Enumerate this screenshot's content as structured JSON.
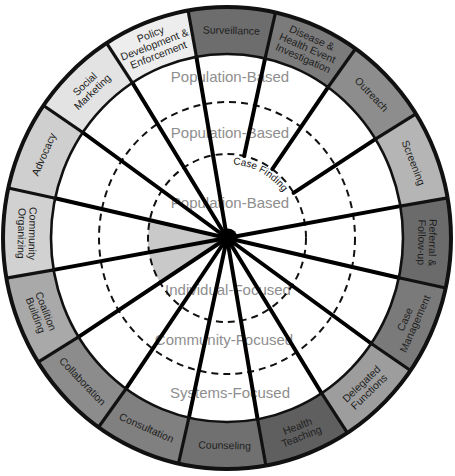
{
  "ring": {
    "segments": [
      {
        "name": "Surveillance",
        "lines": [
          "Surveillance"
        ],
        "color": "#6d6d6d"
      },
      {
        "name": "Disease & Health Event Investigation",
        "lines": [
          "Disease &",
          "Health Event",
          "Investigation"
        ],
        "color": "#7b7b7b"
      },
      {
        "name": "Outreach",
        "lines": [
          "Outreach"
        ],
        "color": "#8d8d8d"
      },
      {
        "name": "Screening",
        "lines": [
          "Screening"
        ],
        "color": "#b5b5b5"
      },
      {
        "name": "Referral & Follow-up",
        "lines": [
          "Referral &",
          "Follow-up"
        ],
        "color": "#6b6b6b"
      },
      {
        "name": "Case Management",
        "lines": [
          "Case",
          "Management"
        ],
        "color": "#7a7a7a"
      },
      {
        "name": "Delegated Functions",
        "lines": [
          "Delegated",
          "Functions"
        ],
        "color": "#9d9d9d"
      },
      {
        "name": "Health Teaching",
        "lines": [
          "Health",
          "Teaching"
        ],
        "color": "#5f5f5f"
      },
      {
        "name": "Counseling",
        "lines": [
          "Counseling"
        ],
        "color": "#707070"
      },
      {
        "name": "Consultation",
        "lines": [
          "Consultation"
        ],
        "color": "#808080"
      },
      {
        "name": "Collaboration",
        "lines": [
          "Collaboration"
        ],
        "color": "#8c8c8c"
      },
      {
        "name": "Coalition Building",
        "lines": [
          "Coalition",
          "Building"
        ],
        "color": "#a9a9a9"
      },
      {
        "name": "Community Organizing",
        "lines": [
          "Community",
          "Organizing"
        ],
        "color": "#d1d1d1"
      },
      {
        "name": "Advocacy",
        "lines": [
          "Advocacy"
        ],
        "color": "#cfcfcf"
      },
      {
        "name": "Social Marketing",
        "lines": [
          "Social",
          "Marketing"
        ],
        "color": "#e3e3e3"
      },
      {
        "name": "Policy Development & Enforcement",
        "lines": [
          "Policy",
          "Development &",
          "Enforcement"
        ],
        "color": "#ededed"
      }
    ]
  },
  "interior": {
    "population_based_labels": [
      "Population-Based",
      "Population-Based",
      "Population-Based"
    ],
    "levels": [
      "Individual-Focused",
      "Community-Focused",
      "Systems-Focused"
    ],
    "case_finding_label": "Case Finding"
  },
  "colors": {
    "level_text": "#8e8e8e",
    "highlight_wedge": "#c9c9c9",
    "lines": "#000000",
    "background": "#ffffff"
  }
}
